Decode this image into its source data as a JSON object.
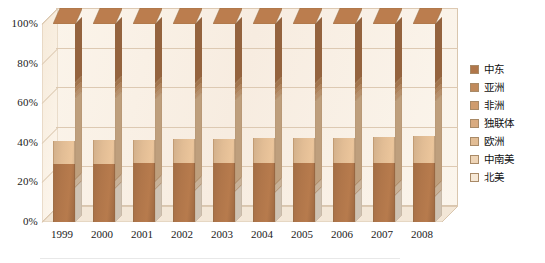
{
  "chart_data": {
    "type": "bar",
    "subtype": "100% stacked column (3-D)",
    "title": "",
    "xlabel": "",
    "ylabel": "",
    "ylim": [
      0,
      100
    ],
    "ytick_labels": [
      "0%",
      "20%",
      "40%",
      "60%",
      "80%",
      "100%"
    ],
    "ytick_values": [
      0,
      20,
      40,
      60,
      80,
      100
    ],
    "grid": true,
    "legend_position": "right",
    "categories": [
      "1999",
      "2000",
      "2001",
      "2002",
      "2003",
      "2004",
      "2005",
      "2006",
      "2007",
      "2008"
    ],
    "series": [
      {
        "name": "北美",
        "color": "#f6e8d6",
        "values": [
          17.5,
          17.0,
          16.5,
          16.0,
          15.5,
          15.0,
          14.5,
          14.0,
          13.5,
          13.0
        ]
      },
      {
        "name": "中南美",
        "color": "#eed4b6",
        "values": [
          4.0,
          4.0,
          4.0,
          4.0,
          4.0,
          4.0,
          4.0,
          4.5,
          4.5,
          4.5
        ]
      },
      {
        "name": "欧洲",
        "color": "#e2bd95",
        "values": [
          41.0,
          41.5,
          41.5,
          42.0,
          42.0,
          42.5,
          42.5,
          42.5,
          43.0,
          43.5
        ]
      },
      {
        "name": "独联体",
        "color": "#d9ab80",
        "values": [
          2.5,
          2.5,
          2.5,
          2.5,
          2.5,
          2.5,
          3.0,
          3.0,
          3.0,
          3.0
        ]
      },
      {
        "name": "非洲",
        "color": "#cf9c6e",
        "values": [
          2.5,
          2.5,
          2.5,
          2.5,
          2.5,
          2.5,
          2.5,
          2.5,
          2.5,
          2.5
        ]
      },
      {
        "name": "亚洲",
        "color": "#c08a5c",
        "values": [
          3.0,
          3.0,
          3.0,
          3.0,
          3.5,
          3.5,
          3.5,
          3.5,
          3.5,
          3.5
        ]
      },
      {
        "name": "中东",
        "color": "#b0764a",
        "values": [
          29.5,
          29.5,
          30.0,
          30.0,
          30.0,
          30.0,
          30.0,
          30.0,
          30.0,
          30.0
        ]
      }
    ]
  },
  "legend": {
    "items": [
      {
        "label": "中东",
        "color": "#b0764a"
      },
      {
        "label": "亚洲",
        "color": "#c08a5c"
      },
      {
        "label": "非洲",
        "color": "#cf9c6e"
      },
      {
        "label": "独联体",
        "color": "#d9ab80"
      },
      {
        "label": "欧洲",
        "color": "#e2bd95"
      },
      {
        "label": "中南美",
        "color": "#eed4b6"
      },
      {
        "label": "北美",
        "color": "#f6e8d6"
      }
    ]
  },
  "colors": {
    "plot_background": "#fbf4ea",
    "gridline": "#ddc9b2",
    "axis_text": "#1a1a1a"
  }
}
